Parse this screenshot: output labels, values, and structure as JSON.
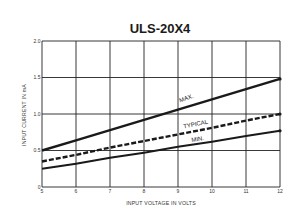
{
  "chart_data": {
    "type": "line",
    "title": "ULS-20X4",
    "xlabel": "INPUT VOLTAGE IN VOLTS",
    "ylabel": "INPUT CURRENT IN mA",
    "x": [
      5,
      6,
      7,
      8,
      9,
      10,
      11,
      12
    ],
    "x_tick_labels": [
      "5",
      "6",
      "7",
      "8",
      "9",
      "10",
      "11",
      "12"
    ],
    "y_tick_labels": [
      "0",
      "0.5",
      "1.0",
      "1.5",
      "2.0"
    ],
    "y_ticks": [
      0,
      0.5,
      1.0,
      1.5,
      2.0
    ],
    "xlim": [
      5,
      12
    ],
    "ylim": [
      0,
      2.0
    ],
    "grid": true,
    "legend": "inline labels",
    "series": [
      {
        "name": "MAX.",
        "style": "solid-thick",
        "values": [
          0.5,
          0.64,
          0.78,
          0.92,
          1.06,
          1.2,
          1.34,
          1.48
        ]
      },
      {
        "name": "TYPICAL",
        "style": "dashed",
        "values": [
          0.35,
          0.44,
          0.54,
          0.63,
          0.72,
          0.81,
          0.91,
          1.0
        ]
      },
      {
        "name": "MIN.",
        "style": "solid",
        "values": [
          0.25,
          0.32,
          0.4,
          0.47,
          0.55,
          0.62,
          0.7,
          0.77
        ]
      }
    ]
  },
  "colors": {
    "line": "#1a1a1a",
    "grid": "#222222",
    "background": "#ffffff"
  }
}
